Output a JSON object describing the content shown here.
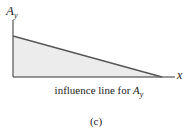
{
  "diagram": {
    "y_axis_label": {
      "main": "A",
      "sub": "y"
    },
    "x_axis_label": "x",
    "caption": {
      "text": "influence line for ",
      "var_main": "A",
      "var_sub": "y"
    },
    "panel_label": "(c)",
    "colors": {
      "fill": "#ececec",
      "line": "#555555",
      "axis": "#333333"
    },
    "geometry": {
      "origin": [
        13,
        77
      ],
      "y_axis_top": 20,
      "x_axis_end": 175,
      "line_start": [
        13,
        36
      ],
      "line_end": [
        162,
        77
      ]
    }
  }
}
